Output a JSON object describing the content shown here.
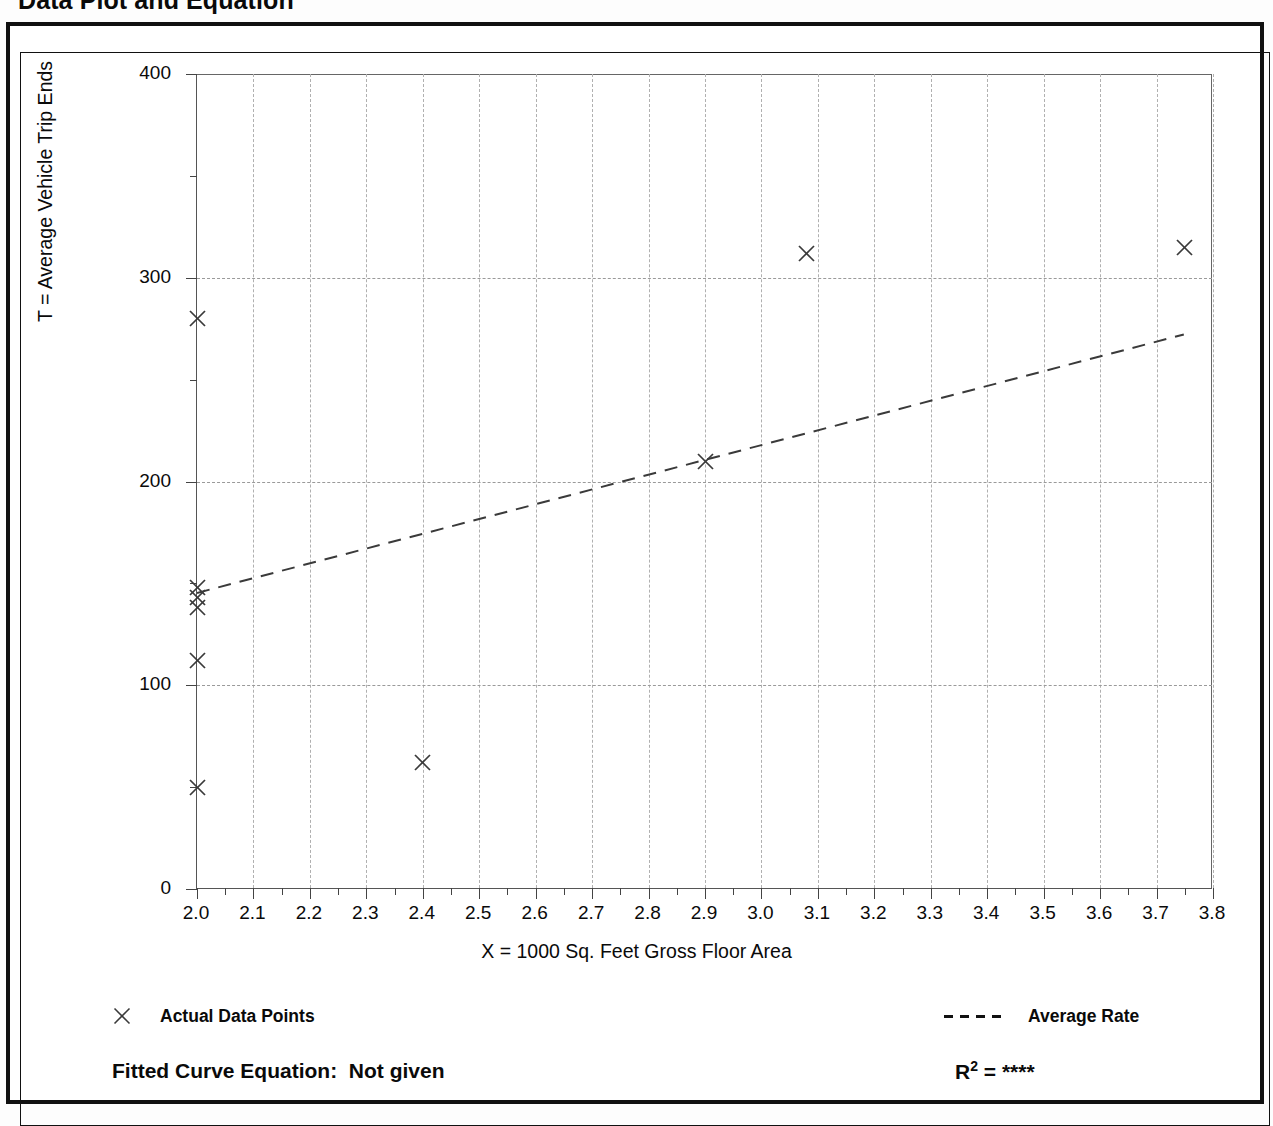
{
  "page": {
    "title": "Data Plot and Equation"
  },
  "axes": {
    "y_title": "T = Average Vehicle Trip Ends",
    "x_title": "X = 1000 Sq. Feet Gross Floor Area",
    "y_ticks": [
      "0",
      "100",
      "200",
      "300",
      "400"
    ],
    "x_ticks": [
      "2.0",
      "2.1",
      "2.2",
      "2.3",
      "2.4",
      "2.5",
      "2.6",
      "2.7",
      "2.8",
      "2.9",
      "3.0",
      "3.1",
      "3.2",
      "3.3",
      "3.4",
      "3.5",
      "3.6",
      "3.7",
      "3.8"
    ]
  },
  "legend": {
    "points_label": "Actual Data Points",
    "points_marker": "x-marker-icon",
    "rate_label": "Average Rate",
    "rate_marker": "dashed-line-icon"
  },
  "footer": {
    "equation_label": "Fitted Curve Equation:",
    "equation_value": "Not given",
    "r2_label": "R",
    "r2_exponent": "2",
    "r2_equals": "=",
    "r2_value": "****"
  },
  "colors": {
    "frame": "#111111",
    "axis": "#444444",
    "gridline": "#9a9a9a",
    "marker": "#3a3a3a",
    "trend": "#3a3a3a",
    "background": "#ffffff"
  },
  "chart_data": {
    "type": "scatter",
    "title": "Data Plot and Equation",
    "xlabel": "X = 1000 Sq. Feet Gross Floor Area",
    "ylabel": "T = Average Vehicle Trip Ends",
    "xlim": [
      2.0,
      3.8
    ],
    "ylim": [
      0,
      400
    ],
    "x_tick_step": 0.1,
    "y_tick_step": 100,
    "y_minor_tick_step": 50,
    "grid": true,
    "grid_style": "dashed",
    "legend_position": "below-plot",
    "series": [
      {
        "name": "Actual Data Points",
        "marker": "x",
        "points": [
          {
            "x": 2.0,
            "y": 280
          },
          {
            "x": 2.0,
            "y": 148
          },
          {
            "x": 2.0,
            "y": 143
          },
          {
            "x": 2.0,
            "y": 138
          },
          {
            "x": 2.0,
            "y": 112
          },
          {
            "x": 2.0,
            "y": 50
          },
          {
            "x": 2.4,
            "y": 62
          },
          {
            "x": 2.9,
            "y": 210
          },
          {
            "x": 3.08,
            "y": 312
          },
          {
            "x": 3.75,
            "y": 315
          }
        ]
      },
      {
        "name": "Average Rate",
        "type": "line",
        "style": "dashed",
        "points": [
          {
            "x": 2.0,
            "y": 145
          },
          {
            "x": 3.75,
            "y": 272
          }
        ]
      }
    ],
    "annotations": {
      "fitted_curve_equation": "Not given",
      "r_squared": "****"
    }
  }
}
